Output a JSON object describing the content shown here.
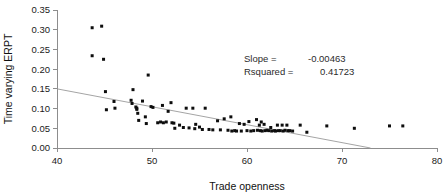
{
  "chart_data": {
    "type": "scatter",
    "title": "",
    "xlabel": "Trade openness",
    "ylabel": "Time varying ERPT",
    "xlim": [
      40,
      80
    ],
    "ylim": [
      0.0,
      0.35
    ],
    "xticks": [
      40,
      50,
      60,
      70,
      80
    ],
    "xtick_labels": [
      "40",
      "50",
      "60",
      "70",
      "80"
    ],
    "yticks": [
      0.0,
      0.05,
      0.1,
      0.15,
      0.2,
      0.25,
      0.3,
      0.35
    ],
    "ytick_labels": [
      "0.00",
      "0.05",
      "0.10",
      "0.15",
      "0.20",
      "0.25",
      "0.30",
      "0.35"
    ],
    "grid": false,
    "legend": "none",
    "annotations": [
      {
        "label": "Slope =",
        "value": "-0.00463"
      },
      {
        "label": "Rsquared =",
        "value": "0.41723"
      }
    ],
    "series": [
      {
        "name": "Time varying ERPT",
        "marker": "filled-square-dot",
        "color": "#0d0d0d",
        "points": [
          [
            43.7,
            0.305
          ],
          [
            44.7,
            0.309
          ],
          [
            43.7,
            0.234
          ],
          [
            44.9,
            0.225
          ],
          [
            45.1,
            0.143
          ],
          [
            45.2,
            0.097
          ],
          [
            46.0,
            0.118
          ],
          [
            46.1,
            0.101
          ],
          [
            47.8,
            0.121
          ],
          [
            47.9,
            0.113
          ],
          [
            48.0,
            0.148
          ],
          [
            48.3,
            0.104
          ],
          [
            48.4,
            0.101
          ],
          [
            48.4,
            0.098
          ],
          [
            48.5,
            0.088
          ],
          [
            48.6,
            0.07
          ],
          [
            49.0,
            0.119
          ],
          [
            49.3,
            0.079
          ],
          [
            49.4,
            0.062
          ],
          [
            49.6,
            0.185
          ],
          [
            49.9,
            0.105
          ],
          [
            50.1,
            0.103
          ],
          [
            50.6,
            0.064
          ],
          [
            50.9,
            0.066
          ],
          [
            51.1,
            0.108
          ],
          [
            51.2,
            0.064
          ],
          [
            51.5,
            0.066
          ],
          [
            51.7,
            0.093
          ],
          [
            52.0,
            0.115
          ],
          [
            52.1,
            0.064
          ],
          [
            52.3,
            0.063
          ],
          [
            52.4,
            0.05
          ],
          [
            52.9,
            0.058
          ],
          [
            53.3,
            0.052
          ],
          [
            53.6,
            0.101
          ],
          [
            53.9,
            0.051
          ],
          [
            54.3,
            0.101
          ],
          [
            54.5,
            0.049
          ],
          [
            54.6,
            0.06
          ],
          [
            55.0,
            0.053
          ],
          [
            55.3,
            0.047
          ],
          [
            55.6,
            0.101
          ],
          [
            56.0,
            0.047
          ],
          [
            56.4,
            0.046
          ],
          [
            56.9,
            0.069
          ],
          [
            57.2,
            0.046
          ],
          [
            57.6,
            0.074
          ],
          [
            58.0,
            0.045
          ],
          [
            58.3,
            0.079
          ],
          [
            58.4,
            0.043
          ],
          [
            58.7,
            0.044
          ],
          [
            58.9,
            0.043
          ],
          [
            59.2,
            0.062
          ],
          [
            59.4,
            0.043
          ],
          [
            59.7,
            0.06
          ],
          [
            60.0,
            0.044
          ],
          [
            60.2,
            0.067
          ],
          [
            60.4,
            0.043
          ],
          [
            60.7,
            0.044
          ],
          [
            61.0,
            0.072
          ],
          [
            61.1,
            0.045
          ],
          [
            61.3,
            0.058
          ],
          [
            61.4,
            0.044
          ],
          [
            61.5,
            0.066
          ],
          [
            61.6,
            0.043
          ],
          [
            61.8,
            0.06
          ],
          [
            61.9,
            0.044
          ],
          [
            62.1,
            0.045
          ],
          [
            62.3,
            0.044
          ],
          [
            62.5,
            0.052
          ],
          [
            62.6,
            0.043
          ],
          [
            62.9,
            0.044
          ],
          [
            63.0,
            0.043
          ],
          [
            63.2,
            0.058
          ],
          [
            63.3,
            0.044
          ],
          [
            63.5,
            0.044
          ],
          [
            63.7,
            0.058
          ],
          [
            63.8,
            0.043
          ],
          [
            64.0,
            0.045
          ],
          [
            64.2,
            0.058
          ],
          [
            64.3,
            0.044
          ],
          [
            64.5,
            0.044
          ],
          [
            64.8,
            0.043
          ],
          [
            65.6,
            0.058
          ],
          [
            66.3,
            0.04
          ],
          [
            68.4,
            0.056
          ],
          [
            71.3,
            0.05
          ],
          [
            75.0,
            0.056
          ],
          [
            76.4,
            0.056
          ]
        ]
      }
    ],
    "trend": {
      "name": "linear-fit",
      "color": "#9a9a9a",
      "x_start": 40.0,
      "y_start": 0.15,
      "x_end": 73.0,
      "y_end": 0.0
    }
  }
}
